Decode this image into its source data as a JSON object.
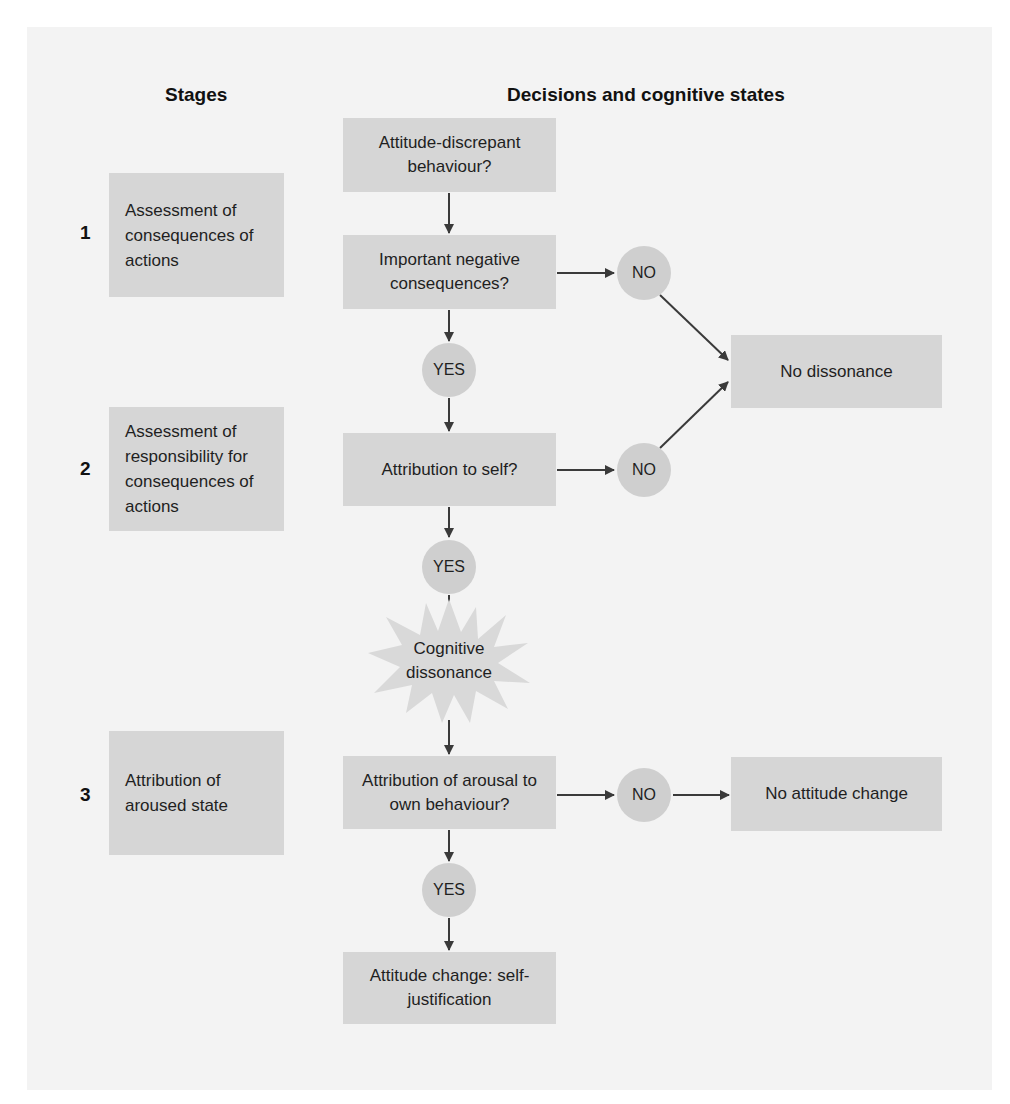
{
  "headers": {
    "stages": "Stages",
    "decisions": "Decisions and cognitive states"
  },
  "stages": [
    {
      "number": "1",
      "label": "Assessment of consequences of actions"
    },
    {
      "number": "2",
      "label": "Assessment of responsibility for consequences of actions"
    },
    {
      "number": "3",
      "label": "Attribution of aroused state"
    }
  ],
  "nodes": {
    "start": "Attitude-discrepant behaviour?",
    "important": "Important negative consequences?",
    "self": "Attribution to self?",
    "dissonance": "Cognitive dissonance",
    "arousal": "Attribution of arousal to own behaviour?",
    "change": "Attitude change: self-justification",
    "no_dissonance": "No dissonance",
    "no_change": "No attitude change"
  },
  "answers": {
    "yes": "YES",
    "no": "NO"
  },
  "colors": {
    "panel": "#f3f3f3",
    "box": "#d6d6d6",
    "circle": "#cfcfcf",
    "arrow": "#3a3a3a"
  }
}
